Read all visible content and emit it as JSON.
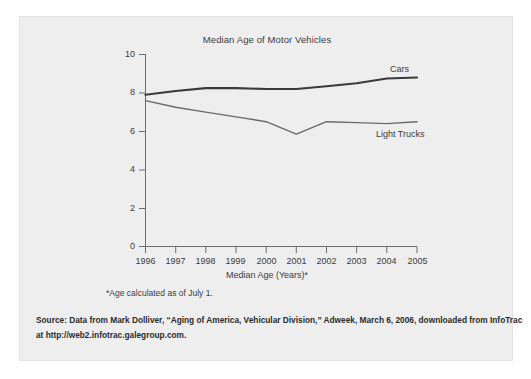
{
  "figure": {
    "background_color": "#eeeeee",
    "page_color": "#ffffff",
    "footnote": "*Age calculated as of July 1.",
    "source_line_1": "Source: Data from Mark Dolliver, “Aging of America, Vehicular Division,” Adweek, March 6, 2006, downloaded from InfoTrac",
    "source_line_2": "at http://web2.infotrac.galegroup.com."
  },
  "chart_data": {
    "type": "line",
    "title": "Median Age of Motor Vehicles",
    "xlabel": "Median Age (Years)*",
    "ylabel": "",
    "categories": [
      "1996",
      "1997",
      "1998",
      "1999",
      "2000",
      "2001",
      "2002",
      "2003",
      "2004",
      "2005"
    ],
    "x_tick_labels": [
      "1996",
      "1997",
      "1998",
      "1999",
      "2000",
      "2001",
      "2002",
      "2003",
      "2004",
      "2005"
    ],
    "y_tick_labels": [
      "0",
      "2",
      "4",
      "6",
      "8",
      "10"
    ],
    "y_ticks": [
      0,
      2,
      4,
      6,
      8,
      10
    ],
    "ylim": [
      0,
      10
    ],
    "xlim": [
      "1996",
      "2005"
    ],
    "grid": false,
    "legend_position": "inline-right",
    "series": [
      {
        "name": "Cars",
        "color": "#3a3a3a",
        "line_width": 2.1,
        "values": [
          7.9,
          8.1,
          8.25,
          8.25,
          8.2,
          8.2,
          8.35,
          8.5,
          8.75,
          8.8
        ]
      },
      {
        "name": "Light Trucks",
        "color": "#6a6a6a",
        "line_width": 1.4,
        "values": [
          7.6,
          7.25,
          7.0,
          6.75,
          6.5,
          5.85,
          6.5,
          6.45,
          6.4,
          6.5
        ]
      }
    ],
    "annotations": [
      {
        "text": "Cars",
        "series": "Cars"
      },
      {
        "text": "Light Trucks",
        "series": "Light Trucks"
      }
    ]
  },
  "axis": {
    "axis_color": "#6d6d6d",
    "tick_color": "#6d6d6d"
  }
}
